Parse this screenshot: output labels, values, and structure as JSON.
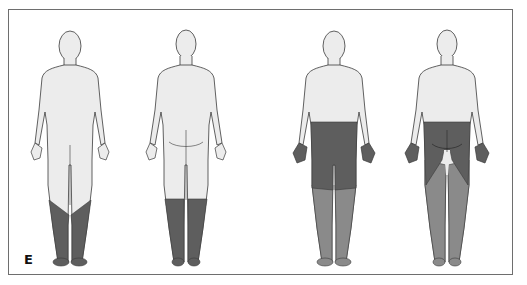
{
  "figure": {
    "panel_label": "E",
    "colors": {
      "skin": "#ececec",
      "outline": "#3a3a3a",
      "dark_shade": "#5e5e5e",
      "medium_shade": "#8a8a8a",
      "border": "#6e6e6e"
    },
    "figures": [
      {
        "id": "fig1",
        "view": "anterior",
        "shaded_regions": [
          {
            "region": "lower legs and feet (stocking distribution)",
            "shade": "dark"
          }
        ]
      },
      {
        "id": "fig2",
        "view": "posterior",
        "shaded_regions": [
          {
            "region": "lower legs and feet (stocking distribution)",
            "shade": "dark"
          }
        ]
      },
      {
        "id": "fig3",
        "view": "anterior",
        "shaded_regions": [
          {
            "region": "hands",
            "shade": "dark"
          },
          {
            "region": "waist to knees",
            "shade": "dark"
          },
          {
            "region": "lower legs and feet",
            "shade": "medium"
          }
        ]
      },
      {
        "id": "fig4",
        "view": "posterior",
        "shaded_regions": [
          {
            "region": "hands",
            "shade": "dark"
          },
          {
            "region": "buttocks and posterior thighs",
            "shade": "dark"
          },
          {
            "region": "lower legs and feet",
            "shade": "medium"
          }
        ]
      }
    ]
  }
}
